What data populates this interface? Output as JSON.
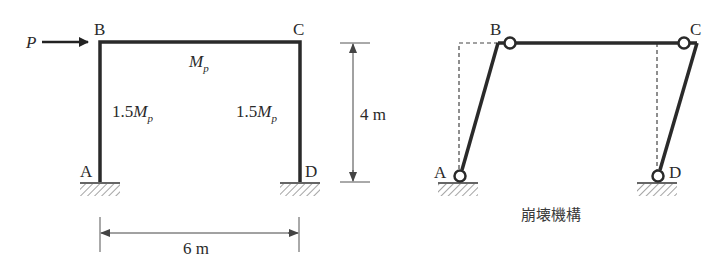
{
  "left_figure": {
    "load_label": "P",
    "nodes": {
      "A": "A",
      "B": "B",
      "C": "C",
      "D": "D"
    },
    "beam_moment": {
      "main": "M",
      "sub": "p"
    },
    "left_column_moment": {
      "coef": "1.5",
      "main": "M",
      "sub": "p"
    },
    "right_column_moment": {
      "coef": "1.5",
      "main": "M",
      "sub": "p"
    },
    "height_dimension": "4 m",
    "span_dimension": "6 m"
  },
  "right_figure": {
    "nodes": {
      "A": "A",
      "B": "B",
      "C": "C",
      "D": "D"
    },
    "caption": "崩壊機構"
  },
  "colors": {
    "member": "#2a2a2a",
    "dimension": "#555555",
    "hatch": "#777777"
  }
}
